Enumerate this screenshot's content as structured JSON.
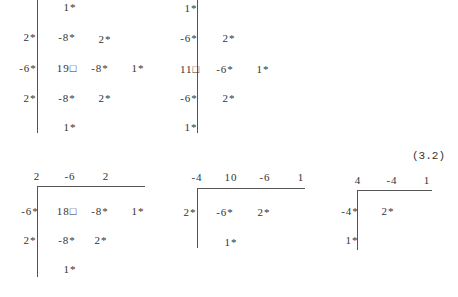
{
  "equation_label": "(3.2)",
  "stencils": [
    {
      "id": "A",
      "vline": {
        "x": 37,
        "y1": 0,
        "y2": 133
      },
      "cells": [
        {
          "x": 70,
          "y": 7,
          "t": "1*"
        },
        {
          "x": 30,
          "y": 37,
          "t": "2*"
        },
        {
          "x": 67,
          "y": 37,
          "t": "-8*"
        },
        {
          "x": 105,
          "y": 39,
          "t": "2*"
        },
        {
          "x": 28,
          "y": 68,
          "t": "-6*"
        },
        {
          "x": 67,
          "y": 68,
          "t": "19□"
        },
        {
          "x": 100,
          "y": 68,
          "t": "-8*"
        },
        {
          "x": 138,
          "y": 68,
          "t": "1*"
        },
        {
          "x": 30,
          "y": 98,
          "t": "2*"
        },
        {
          "x": 67,
          "y": 98,
          "t": "-8*"
        },
        {
          "x": 105,
          "y": 98,
          "t": "2*"
        },
        {
          "x": 70,
          "y": 127,
          "t": "1*"
        }
      ]
    },
    {
      "id": "B",
      "vline": {
        "x": 197,
        "y1": 0,
        "y2": 133
      },
      "cells": [
        {
          "x": 191,
          "y": 8,
          "t": "1*"
        },
        {
          "x": 189,
          "y": 38,
          "t": "-6*"
        },
        {
          "x": 229,
          "y": 38,
          "t": "2*"
        },
        {
          "x": 190,
          "y": 69,
          "t": "11□"
        },
        {
          "x": 225,
          "y": 69,
          "t": "-6*"
        },
        {
          "x": 263,
          "y": 69,
          "t": "1*"
        },
        {
          "x": 189,
          "y": 98,
          "t": "-6*"
        },
        {
          "x": 229,
          "y": 98,
          "t": "2*"
        },
        {
          "x": 191,
          "y": 127,
          "t": "1*"
        }
      ]
    },
    {
      "id": "C",
      "vline": {
        "x": 37,
        "y1": 186,
        "y2": 277
      },
      "hline": {
        "y": 186,
        "x1": 37,
        "x2": 145
      },
      "cells": [
        {
          "x": 37,
          "y": 176,
          "t": "2"
        },
        {
          "x": 70,
          "y": 176,
          "t": "-6"
        },
        {
          "x": 106,
          "y": 176,
          "t": "2"
        },
        {
          "x": 30,
          "y": 211,
          "t": "-6*"
        },
        {
          "x": 67,
          "y": 211,
          "t": "18□"
        },
        {
          "x": 100,
          "y": 211,
          "t": "-8*"
        },
        {
          "x": 138,
          "y": 211,
          "t": "1*"
        },
        {
          "x": 30,
          "y": 240,
          "t": "2*"
        },
        {
          "x": 67,
          "y": 240,
          "t": "-8*"
        },
        {
          "x": 101,
          "y": 240,
          "t": "2*"
        },
        {
          "x": 70,
          "y": 269,
          "t": "1*"
        }
      ]
    },
    {
      "id": "D",
      "vline": {
        "x": 197,
        "y1": 188,
        "y2": 248
      },
      "hline": {
        "y": 188,
        "x1": 197,
        "x2": 305
      },
      "cells": [
        {
          "x": 197,
          "y": 177,
          "t": "-4"
        },
        {
          "x": 231,
          "y": 177,
          "t": "10"
        },
        {
          "x": 265,
          "y": 177,
          "t": "-6"
        },
        {
          "x": 301,
          "y": 177,
          "t": "1"
        },
        {
          "x": 190,
          "y": 212,
          "t": "2*"
        },
        {
          "x": 225,
          "y": 212,
          "t": "-6*"
        },
        {
          "x": 264,
          "y": 212,
          "t": "2*"
        },
        {
          "x": 231,
          "y": 242,
          "t": "1*"
        }
      ]
    },
    {
      "id": "E",
      "vline": {
        "x": 357,
        "y1": 190,
        "y2": 250
      },
      "hline": {
        "y": 190,
        "x1": 357,
        "x2": 432
      },
      "cells": [
        {
          "x": 358,
          "y": 180,
          "t": "4"
        },
        {
          "x": 392,
          "y": 180,
          "t": "-4"
        },
        {
          "x": 427,
          "y": 180,
          "t": "1"
        },
        {
          "x": 350,
          "y": 211,
          "t": "-4*"
        },
        {
          "x": 388,
          "y": 211,
          "t": "2*"
        },
        {
          "x": 352,
          "y": 240,
          "t": "1*"
        }
      ]
    }
  ]
}
